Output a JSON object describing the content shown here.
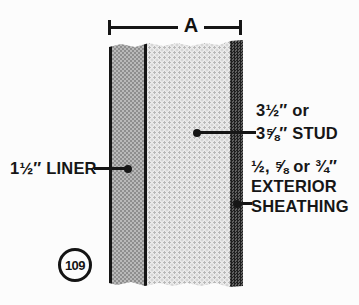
{
  "figure": {
    "dimension": {
      "label": "A"
    },
    "figure_number": "109",
    "callouts": {
      "liner": {
        "text": "1½″ LINER"
      },
      "stud": {
        "line1": "3½″ or",
        "line2": "3⅝″ STUD"
      },
      "sheathing": {
        "line1": "½, ⅝ or ¾″",
        "line2": "EXTERIOR",
        "line3": "SHEATHING"
      }
    },
    "layers": [
      {
        "name": "liner",
        "description": "1½″ LINER"
      },
      {
        "name": "stud",
        "description": "3½″ or 3⅝″ STUD"
      },
      {
        "name": "exterior-sheathing",
        "description": "½, ⅝ or ¾″ EXTERIOR SHEATHING"
      }
    ],
    "colors": {
      "ink": "#161616",
      "background": "#fcfcfc",
      "liner_pattern_dark": "#8e8e8e",
      "liner_pattern_light": "#b9b9b9",
      "stud_background": "#ececec",
      "stud_dot": "#b9b9b9",
      "sheathing_pattern_dark": "#1f1f1f",
      "sheathing_pattern_light": "#5f5f5f"
    }
  }
}
